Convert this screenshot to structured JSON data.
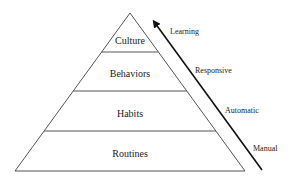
{
  "diagram": {
    "type": "pyramid",
    "tiers": [
      {
        "label": "Culture",
        "position": "top"
      },
      {
        "label": "Behaviors",
        "position": "upper-middle"
      },
      {
        "label": "Habits",
        "position": "lower-middle"
      },
      {
        "label": "Routines",
        "position": "bottom"
      }
    ],
    "arrow": {
      "direction": "up",
      "stages": [
        {
          "label": "Learning"
        },
        {
          "label": "Responsive"
        },
        {
          "label": "Automatic"
        },
        {
          "label": "Manual"
        }
      ]
    },
    "colors": {
      "outline": "#555555",
      "arrow": "#111111",
      "text": "#222222",
      "background": "#ffffff"
    }
  }
}
